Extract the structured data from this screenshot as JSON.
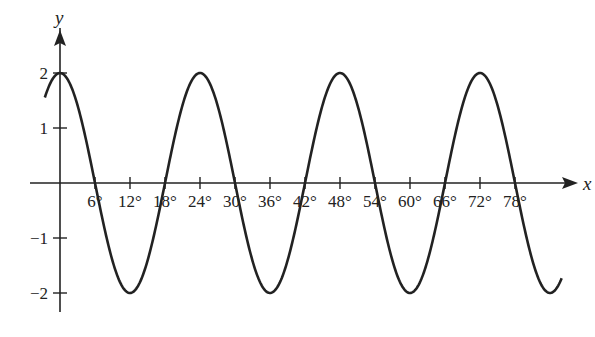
{
  "chart_data": {
    "type": "line",
    "title": "",
    "xlabel": "x",
    "ylabel": "y",
    "function": "y = 2cos(15x)",
    "amplitude": 2,
    "period_deg": 24,
    "x_range_deg": [
      -2.6,
      86
    ],
    "ylim": [
      -2,
      2
    ],
    "grid": false,
    "legend": null,
    "x_ticks": [
      6,
      12,
      18,
      24,
      30,
      36,
      42,
      48,
      54,
      60,
      66,
      72,
      78
    ],
    "x_tick_labels": [
      "6°",
      "12°",
      "18°",
      "24°",
      "30°",
      "36°",
      "42°",
      "48°",
      "54°",
      "60°",
      "66°",
      "72°",
      "78°"
    ],
    "y_ticks": [
      2,
      1,
      -1,
      -2
    ],
    "y_tick_labels": [
      "2",
      "1",
      "−1",
      "−2"
    ],
    "maxima_x_deg": [
      0,
      24,
      48,
      72
    ],
    "minima_x_deg": [
      12,
      36,
      60
    ],
    "zeros_x_deg": [
      6,
      18,
      30,
      42,
      54,
      66,
      78
    ],
    "color": "#222222"
  }
}
